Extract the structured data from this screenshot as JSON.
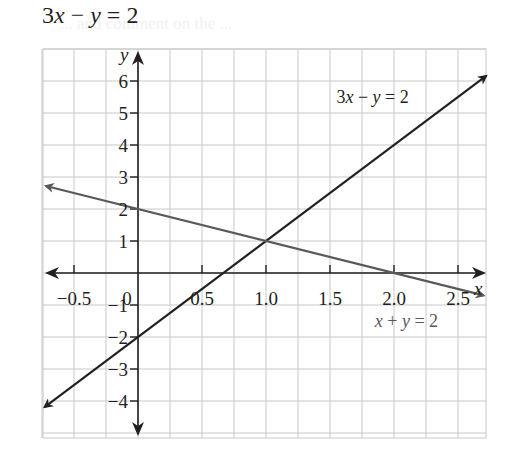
{
  "header": {
    "title": "3x − y = 2",
    "background_ghost_text": "... and comment on the ..."
  },
  "colors": {
    "grid": "#c8c8c8",
    "axis": "#231f20",
    "line_3x_minus_y": "#231f20",
    "line_x_plus_y": "#58595b",
    "label_x_plus_y": "#58595b"
  },
  "chart_data": {
    "type": "line",
    "title": "3x − y = 2",
    "xlabel": "x",
    "ylabel": "y",
    "xlim": [
      -0.75,
      2.72
    ],
    "ylim": [
      -5.2,
      7.0
    ],
    "grid": true,
    "grid_step_x": 0.25,
    "grid_step_y": 1,
    "x_ticks": [
      -0.5,
      0,
      0.5,
      1.0,
      1.5,
      2.0,
      2.5
    ],
    "x_tick_labels": [
      "−0.5",
      "0",
      "0.5",
      "1.0",
      "1.5",
      "2.0",
      "2.5"
    ],
    "y_ticks": [
      -4,
      -3,
      -2,
      -1,
      1,
      2,
      3,
      4,
      5,
      6
    ],
    "y_tick_labels": [
      "−4",
      "−3",
      "−2",
      "−1",
      "1",
      "2",
      "3",
      "4",
      "5",
      "6"
    ],
    "series": [
      {
        "name": "3x − y = 2",
        "equation": "y = 3x − 2",
        "color": "#231f20",
        "x": [
          -0.73,
          0,
          0.5,
          0.667,
          1.0,
          2.0,
          2.72
        ],
        "y": [
          -4.19,
          -2,
          -0.5,
          0,
          1,
          4,
          6.16
        ],
        "arrows": "both"
      },
      {
        "name": "x + y = 2",
        "equation": "y = 2 − x",
        "color": "#58595b",
        "x": [
          -0.72,
          0,
          1.0,
          2.0,
          2.7
        ],
        "y": [
          2.72,
          2,
          1,
          0,
          -0.7
        ],
        "arrows": "both"
      }
    ],
    "annotations": [
      {
        "text": "3x − y = 2",
        "x": 1.55,
        "y": 5.3
      },
      {
        "text": "x + y = 2",
        "x": 1.85,
        "y": -1.7
      }
    ],
    "intersection": {
      "x": 1.0,
      "y": 1.0
    },
    "legend": "none (inline labels)"
  }
}
